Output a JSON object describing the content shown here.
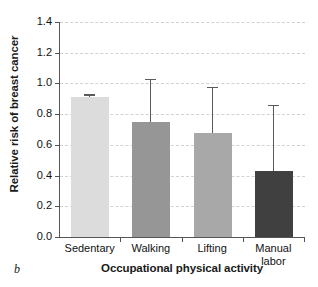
{
  "panel_label": "b",
  "chart_data": {
    "type": "bar",
    "title": "",
    "xlabel": "Occupational physical activity",
    "ylabel": "Relative risk of breast cancer",
    "categories": [
      "Sedentary",
      "Walking",
      "Lifting",
      "Manual labor"
    ],
    "values": [
      0.91,
      0.75,
      0.68,
      0.43
    ],
    "error_upper": [
      0.92,
      1.02,
      0.97,
      0.85
    ],
    "bar_colors": [
      "#dcdcdc",
      "#969696",
      "#a8a8a8",
      "#404040"
    ],
    "ylim": [
      0.0,
      1.4
    ],
    "ytick_labels": [
      "0.0",
      "0.2",
      "0.4",
      "0.6",
      "0.8",
      "1.0",
      "1.2",
      "1.4"
    ],
    "ytick_values": [
      0.0,
      0.2,
      0.4,
      0.6,
      0.8,
      1.0,
      1.2,
      1.4
    ],
    "grid": true,
    "legend": "none",
    "axis_color": "#555555",
    "grid_color": "#d2d2d2",
    "error_bar_color": "#5a5a5a"
  },
  "xtick_lines": [
    [
      "Sedentary",
      ""
    ],
    [
      "Walking",
      ""
    ],
    [
      "Lifting",
      ""
    ],
    [
      "Manual",
      "labor"
    ]
  ]
}
